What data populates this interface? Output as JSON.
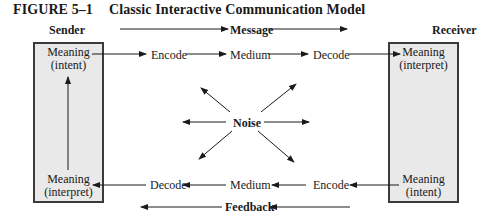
{
  "figure": {
    "number": "FIGURE 5–1",
    "title": "Classic Interactive Communication Model"
  },
  "headers": {
    "sender": "Sender",
    "message": "Message",
    "receiver": "Receiver",
    "feedback": "Feedback"
  },
  "sender_box": {
    "top": {
      "line1": "Meaning",
      "line2": "(intent)"
    },
    "bottom": {
      "line1": "Meaning",
      "line2": "(interpret)"
    }
  },
  "receiver_box": {
    "top": {
      "line1": "Meaning",
      "line2": "(interpret)"
    },
    "bottom": {
      "line1": "Meaning",
      "line2": "(intent)"
    }
  },
  "top_row": [
    "Encode",
    "Medium",
    "Decode"
  ],
  "bottom_row": [
    "Decode",
    "Medium",
    "Encode"
  ],
  "center": {
    "label": "Noise"
  },
  "colors": {
    "box_fill": "#e9e9e9",
    "box_border": "#3a3a3a",
    "line": "#1a1a1a"
  }
}
